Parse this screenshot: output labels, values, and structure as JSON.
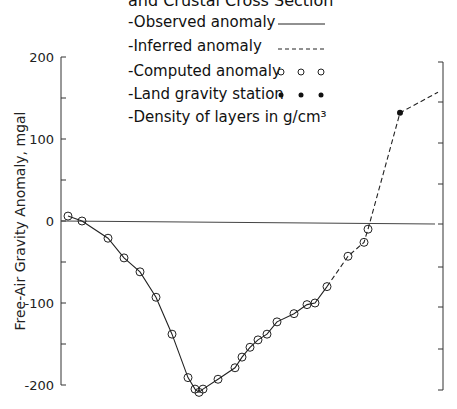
{
  "chart_data": {
    "type": "line",
    "xlabel": "",
    "ylabel": "Free-Air Gravity Anomaly, mgal",
    "ylim": [
      -200,
      200
    ],
    "yticks": [
      200,
      150,
      100,
      50,
      0,
      -50,
      -100,
      -150,
      -200
    ],
    "ytick_labels": [
      "200",
      "",
      "100",
      "",
      "0",
      "",
      "-100",
      "",
      "-200"
    ],
    "grid": false,
    "legend_position": "top-center",
    "legend": [
      {
        "label": "-Observed anomaly",
        "symbol": "solid-line"
      },
      {
        "label": "-Inferred anomaly",
        "symbol": "dashed-line"
      },
      {
        "label": "-Computed anomaly",
        "symbol": "open-circles"
      },
      {
        "label": "-Land gravity station",
        "symbol": "filled-circles"
      },
      {
        "label": "-Density of layers in g/cm³",
        "symbol": "none"
      }
    ],
    "series": [
      {
        "name": "Observed anomaly",
        "style": "solid",
        "x": [
          68,
          82,
          108,
          124,
          140,
          156,
          172,
          188,
          195,
          199,
          203,
          218,
          235,
          242,
          250,
          258,
          267,
          277,
          294,
          307,
          315,
          327
        ],
        "values": [
          6,
          0,
          -21,
          -45,
          -62,
          -93,
          -138,
          -191,
          -205,
          -209,
          -205,
          -193,
          -179,
          -166,
          -154,
          -145,
          -138,
          -123,
          -113,
          -102,
          -100,
          -80
        ]
      },
      {
        "name": "Inferred anomaly",
        "style": "dashed",
        "x": [
          327,
          348,
          364,
          368,
          400,
          438
        ],
        "values": [
          -80,
          -43,
          -26,
          -10,
          132,
          157
        ]
      },
      {
        "name": "Computed anomaly",
        "style": "open-circle",
        "x": [
          68,
          82,
          108,
          124,
          140,
          156,
          172,
          188,
          195,
          199,
          203,
          218,
          235,
          242,
          250,
          258,
          267,
          277,
          294,
          307,
          315,
          327,
          348,
          364,
          368
        ],
        "values": [
          6,
          0,
          -21,
          -45,
          -62,
          -93,
          -138,
          -191,
          -205,
          -209,
          -205,
          -193,
          -179,
          -166,
          -154,
          -145,
          -138,
          -123,
          -113,
          -102,
          -100,
          -80,
          -43,
          -26,
          -10
        ]
      },
      {
        "name": "Land gravity station",
        "style": "filled-circle",
        "x": [
          400
        ],
        "values": [
          132
        ]
      }
    ]
  },
  "labels": {
    "title_partial": "and Crustal Cross Section",
    "ylabel": "Free-Air Gravity Anomaly, mgal",
    "ticks": {
      "t200": "200",
      "t100": "100",
      "t0": "0",
      "tm100": "-100",
      "tm200": "-200"
    },
    "legend": {
      "observed": "-Observed anomaly",
      "inferred": "-Inferred anomaly",
      "computed": "-Computed anomaly",
      "station": "-Land gravity station",
      "density": "-Density of layers in g/cm³"
    }
  }
}
